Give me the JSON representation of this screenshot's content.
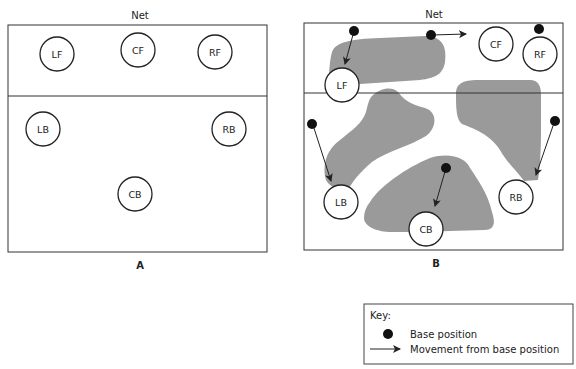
{
  "colors": {
    "line": "#333333",
    "zone": "#9a9a9a",
    "dot": "#111111",
    "background": "#ffffff"
  },
  "diagram_a": {
    "net_label": "Net",
    "caption": "A",
    "positions": [
      {
        "id": "LF",
        "label": "LF"
      },
      {
        "id": "CF",
        "label": "CF"
      },
      {
        "id": "RF",
        "label": "RF"
      },
      {
        "id": "LB",
        "label": "LB"
      },
      {
        "id": "RB",
        "label": "RB"
      },
      {
        "id": "CB",
        "label": "CB"
      }
    ]
  },
  "diagram_b": {
    "net_label": "Net",
    "caption": "B",
    "positions": [
      {
        "id": "LF",
        "label": "LF"
      },
      {
        "id": "CF",
        "label": "CF"
      },
      {
        "id": "RF",
        "label": "RF"
      },
      {
        "id": "LB",
        "label": "LB"
      },
      {
        "id": "RB",
        "label": "RB"
      },
      {
        "id": "CB",
        "label": "CB"
      }
    ]
  },
  "key": {
    "title": "Key:",
    "items": [
      {
        "icon": "dot-icon",
        "label": "Base position"
      },
      {
        "icon": "arrow-icon",
        "label": "Movement from base position"
      }
    ]
  }
}
